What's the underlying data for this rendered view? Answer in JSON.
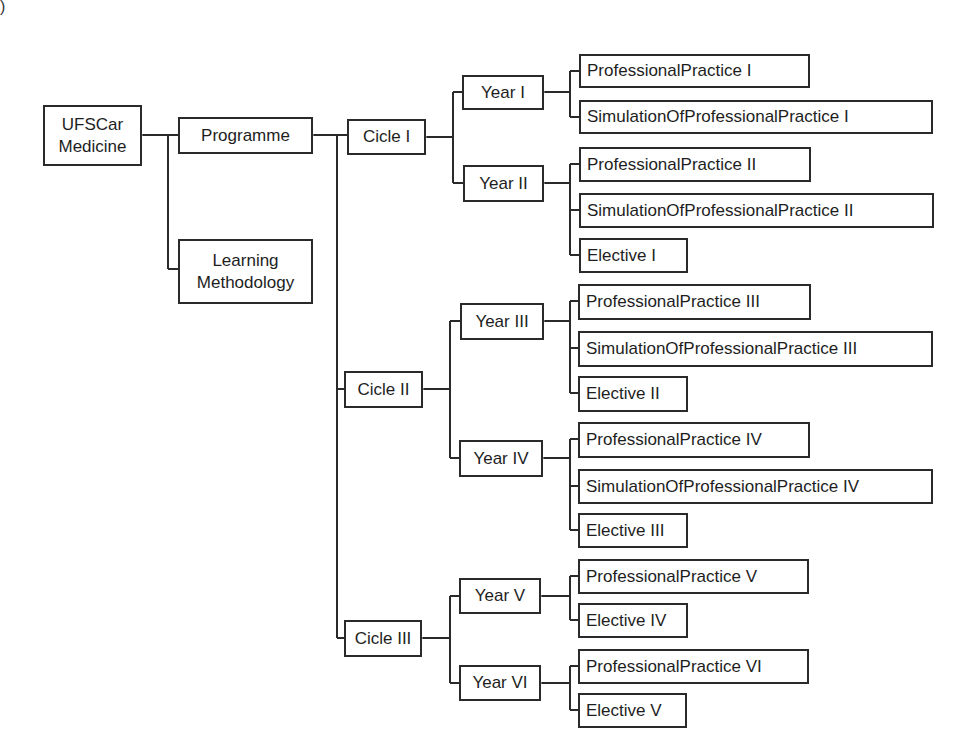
{
  "corner_fragment": ")",
  "root": {
    "id": "ufscar",
    "label_lines": [
      "UFSCar",
      "Medicine"
    ]
  },
  "level1": [
    {
      "id": "programme",
      "label": "Programme"
    },
    {
      "id": "learning",
      "label_lines": [
        "Learning",
        "Methodology"
      ]
    }
  ],
  "cycles": [
    {
      "id": "c1",
      "label": "Cicle I"
    },
    {
      "id": "c2",
      "label": "Cicle II"
    },
    {
      "id": "c3",
      "label": "Cicle III"
    }
  ],
  "years": [
    {
      "id": "y1",
      "label": "Year I"
    },
    {
      "id": "y2",
      "label": "Year II"
    },
    {
      "id": "y3",
      "label": "Year III"
    },
    {
      "id": "y4",
      "label": "Year IV"
    },
    {
      "id": "y5",
      "label": "Year V"
    },
    {
      "id": "y6",
      "label": "Year VI"
    }
  ],
  "leaves": [
    {
      "label": "ProfessionalPractice I"
    },
    {
      "label": "SimulationOfProfessionalPractice I"
    },
    {
      "label": "ProfessionalPractice II"
    },
    {
      "label": "SimulationOfProfessionalPractice II"
    },
    {
      "label": "Elective I"
    },
    {
      "label": "ProfessionalPractice III"
    },
    {
      "label": "SimulationOfProfessionalPractice III"
    },
    {
      "label": "Elective II"
    },
    {
      "label": "ProfessionalPractice IV"
    },
    {
      "label": "SimulationOfProfessionalPractice IV"
    },
    {
      "label": "Elective III"
    },
    {
      "label": "ProfessionalPractice V"
    },
    {
      "label": "Elective IV"
    },
    {
      "label": "ProfessionalPractice VI"
    },
    {
      "label": "Elective V"
    }
  ],
  "colors": {
    "line": "#2a2a2a",
    "border": "#2a2a2a",
    "text": "#1e1e1e",
    "background": "#ffffff"
  }
}
